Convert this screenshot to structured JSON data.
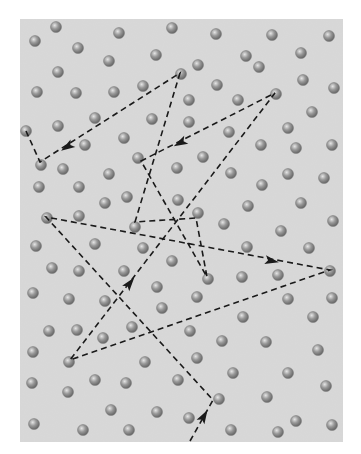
{
  "diagram": {
    "title": "",
    "canvas": {
      "width": 361,
      "height": 454
    },
    "panel": {
      "x": 20,
      "y": 19,
      "width": 323,
      "height": 423,
      "fill": "#d9d9d9"
    },
    "colors": {
      "background": "#ffffff",
      "panel": "#d9d9d9",
      "path": "#1a1a1a",
      "ball_dark": "#6e6e6e",
      "ball_mid": "#9a9a9a",
      "ball_light": "#e6e6e6"
    },
    "ball_radius": 5.5,
    "molecules": [
      [
        35,
        41
      ],
      [
        56,
        27
      ],
      [
        119,
        33
      ],
      [
        172,
        28
      ],
      [
        216,
        34
      ],
      [
        272,
        35
      ],
      [
        329,
        36
      ],
      [
        78,
        48
      ],
      [
        156,
        55
      ],
      [
        109,
        61
      ],
      [
        198,
        65
      ],
      [
        246,
        56
      ],
      [
        259,
        67
      ],
      [
        301,
        53
      ],
      [
        58,
        72
      ],
      [
        181,
        74
      ],
      [
        143,
        86
      ],
      [
        217,
        85
      ],
      [
        303,
        80
      ],
      [
        334,
        88
      ],
      [
        37,
        92
      ],
      [
        76,
        93
      ],
      [
        114,
        92
      ],
      [
        189,
        100
      ],
      [
        238,
        100
      ],
      [
        276,
        94
      ],
      [
        312,
        112
      ],
      [
        95,
        118
      ],
      [
        152,
        119
      ],
      [
        189,
        122
      ],
      [
        58,
        126
      ],
      [
        26,
        131
      ],
      [
        124,
        138
      ],
      [
        229,
        132
      ],
      [
        288,
        128
      ],
      [
        85,
        145
      ],
      [
        261,
        145
      ],
      [
        296,
        148
      ],
      [
        332,
        145
      ],
      [
        138,
        158
      ],
      [
        203,
        157
      ],
      [
        41,
        165
      ],
      [
        63,
        169
      ],
      [
        109,
        174
      ],
      [
        177,
        168
      ],
      [
        231,
        173
      ],
      [
        288,
        174
      ],
      [
        324,
        178
      ],
      [
        39,
        187
      ],
      [
        79,
        187
      ],
      [
        262,
        185
      ],
      [
        127,
        197
      ],
      [
        105,
        203
      ],
      [
        178,
        200
      ],
      [
        248,
        206
      ],
      [
        301,
        203
      ],
      [
        333,
        221
      ],
      [
        47,
        218
      ],
      [
        79,
        216
      ],
      [
        198,
        213
      ],
      [
        224,
        224
      ],
      [
        135,
        227
      ],
      [
        281,
        231
      ],
      [
        36,
        246
      ],
      [
        95,
        244
      ],
      [
        143,
        248
      ],
      [
        247,
        247
      ],
      [
        309,
        248
      ],
      [
        172,
        261
      ],
      [
        52,
        268
      ],
      [
        79,
        271
      ],
      [
        124,
        271
      ],
      [
        278,
        275
      ],
      [
        208,
        279
      ],
      [
        242,
        277
      ],
      [
        330,
        271
      ],
      [
        157,
        287
      ],
      [
        33,
        293
      ],
      [
        69,
        299
      ],
      [
        105,
        301
      ],
      [
        197,
        297
      ],
      [
        288,
        299
      ],
      [
        332,
        298
      ],
      [
        162,
        308
      ],
      [
        243,
        317
      ],
      [
        313,
        317
      ],
      [
        49,
        331
      ],
      [
        77,
        330
      ],
      [
        132,
        327
      ],
      [
        190,
        331
      ],
      [
        103,
        338
      ],
      [
        222,
        341
      ],
      [
        266,
        342
      ],
      [
        318,
        350
      ],
      [
        33,
        352
      ],
      [
        69,
        362
      ],
      [
        145,
        362
      ],
      [
        197,
        358
      ],
      [
        233,
        373
      ],
      [
        288,
        373
      ],
      [
        32,
        383
      ],
      [
        95,
        380
      ],
      [
        126,
        383
      ],
      [
        178,
        380
      ],
      [
        68,
        392
      ],
      [
        326,
        386
      ],
      [
        219,
        399
      ],
      [
        267,
        397
      ],
      [
        111,
        410
      ],
      [
        157,
        412
      ],
      [
        189,
        418
      ],
      [
        296,
        421
      ],
      [
        34,
        424
      ],
      [
        83,
        430
      ],
      [
        129,
        430
      ],
      [
        231,
        430
      ],
      [
        278,
        432
      ],
      [
        332,
        425
      ]
    ],
    "path": {
      "stroke": "#1a1a1a",
      "dash": "6 4",
      "width": 1.6,
      "vertices": [
        [
          190,
          441
        ],
        [
          213,
          400
        ],
        [
          46,
          217
        ],
        [
          330,
          270
        ],
        [
          70,
          360
        ],
        [
          275,
          93
        ],
        [
          141,
          161
        ],
        [
          207,
          277
        ],
        [
          196,
          218
        ],
        [
          135,
          222
        ],
        [
          180,
          73
        ],
        [
          40,
          162
        ],
        [
          26,
          131
        ]
      ],
      "arrows": [
        {
          "x": 204,
          "y": 416,
          "angle": -60
        },
        {
          "x": 272,
          "y": 261,
          "angle": 10.7
        },
        {
          "x": 130,
          "y": 283,
          "angle": -52
        },
        {
          "x": 180,
          "y": 143,
          "angle": 153
        },
        {
          "x": 67,
          "y": 147,
          "angle": 148
        }
      ]
    }
  }
}
